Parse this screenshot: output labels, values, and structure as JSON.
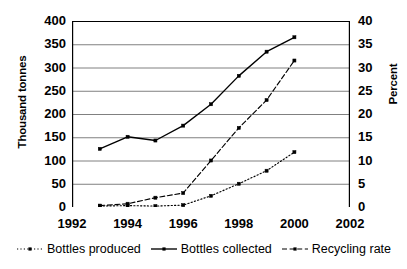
{
  "chart_data": {
    "type": "line",
    "title": "",
    "xlabel": "",
    "ylabel": "Thousand tonnes",
    "y2label": "Percent",
    "x": [
      1993,
      1994,
      1995,
      1996,
      1997,
      1998,
      1999,
      2000
    ],
    "xlim": [
      1992,
      2002
    ],
    "ylim": [
      0,
      400
    ],
    "y2lim": [
      0,
      40
    ],
    "xticks": [
      "1992",
      "1994",
      "1996",
      "1998",
      "2000",
      "2002"
    ],
    "yticks": [
      "0",
      "50",
      "100",
      "150",
      "200",
      "250",
      "300",
      "350",
      "400"
    ],
    "y2ticks": [
      "0",
      "5",
      "10",
      "15",
      "20",
      "25",
      "30",
      "35",
      "40"
    ],
    "grid": "horizontal",
    "legend_position": "bottom",
    "series": [
      {
        "name": "Bottles produced",
        "axis": "left",
        "style": "dotted",
        "marker": "square",
        "values": [
          2,
          3,
          2,
          4,
          24,
          50,
          78,
          118
        ]
      },
      {
        "name": "Bottles collected",
        "axis": "left",
        "style": "solid",
        "marker": "square",
        "values": [
          125,
          151,
          143,
          175,
          221,
          282,
          334,
          365
        ]
      },
      {
        "name": "Recycling rate",
        "axis": "right",
        "style": "dashed",
        "marker": "square",
        "values": [
          0.3,
          0.7,
          2.0,
          3.0,
          10.0,
          17.0,
          23.0,
          31.5
        ]
      }
    ],
    "colors": {
      "line": "#000000",
      "grid": "#808080",
      "axis": "#000000",
      "background": "#ffffff"
    }
  },
  "legend": {
    "items": [
      {
        "label": "Bottles produced"
      },
      {
        "label": "Bottles collected"
      },
      {
        "label": "Recycling rate"
      }
    ]
  }
}
